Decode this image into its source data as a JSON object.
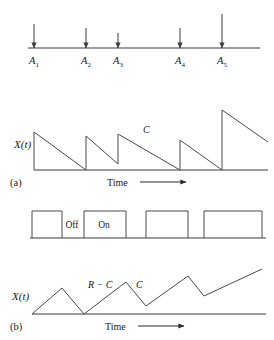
{
  "figure": {
    "caption_panels": [
      "(a)",
      "(b)"
    ],
    "axis_label": "X(t)",
    "time_label": "Time",
    "slope_label_c": "C",
    "slope_label_rc": "R − C",
    "state_off": "Off",
    "state_on": "On",
    "stroke_color": "#4a4a4a",
    "background": "#ffffff"
  },
  "arrivals": {
    "axis": {
      "x_start": 28,
      "x_end": 260,
      "y": 48
    },
    "markers": [
      {
        "label": "A",
        "subscript": "1",
        "x": 34,
        "arrow_top": 24,
        "height": 24
      },
      {
        "label": "A",
        "subscript": "2",
        "x": 86,
        "arrow_top": 28,
        "height": 20
      },
      {
        "label": "A",
        "subscript": "3",
        "x": 118,
        "arrow_top": 33,
        "height": 15
      },
      {
        "label": "A",
        "subscript": "4",
        "x": 180,
        "arrow_top": 28,
        "height": 20
      },
      {
        "label": "A",
        "subscript": "5",
        "x": 222,
        "arrow_top": 14,
        "height": 34
      }
    ],
    "label_y": 64
  },
  "chart_data": [
    {
      "type": "line",
      "name": "panel-a-sawtooth",
      "title": "(a)",
      "xlabel": "Time",
      "ylabel": "X(t)",
      "description": "Sawtooth: instantaneous upward jumps at arrival times A1..A5 followed by linear decay at rate C down to zero.",
      "baseline_y": 170,
      "x_axis": {
        "x_start": 34,
        "x_end": 268
      },
      "ylim": [
        0,
        60
      ],
      "points": [
        {
          "x": 34,
          "y": 0
        },
        {
          "x": 34,
          "y": 38
        },
        {
          "x": 86,
          "y": 0
        },
        {
          "x": 86,
          "y": 34
        },
        {
          "x": 118,
          "y": 6
        },
        {
          "x": 118,
          "y": 36
        },
        {
          "x": 180,
          "y": 0
        },
        {
          "x": 180,
          "y": 30
        },
        {
          "x": 222,
          "y": 0
        },
        {
          "x": 222,
          "y": 60
        },
        {
          "x": 268,
          "y": 28
        }
      ],
      "annotations": [
        {
          "text": "C",
          "x": 143,
          "y": 133
        }
      ]
    },
    {
      "type": "line",
      "name": "panel-middle-server-state",
      "title": "",
      "description": "Square wave showing server alternating between On (high) and Off (low) periods.",
      "baseline_y": 238,
      "high_y": 211,
      "x_axis": {
        "x_start": 30,
        "x_end": 266
      },
      "pulses": [
        {
          "start": 32,
          "end": 62
        },
        {
          "start": 84,
          "end": 126
        },
        {
          "start": 146,
          "end": 188
        },
        {
          "start": 204,
          "end": 262
        }
      ],
      "annotations": [
        {
          "text": "Off",
          "x": 72,
          "y": 228
        },
        {
          "text": "On",
          "x": 104,
          "y": 228
        }
      ]
    },
    {
      "type": "line",
      "name": "panel-b-triangular",
      "title": "(b)",
      "xlabel": "Time",
      "ylabel": "X(t)",
      "description": "Triangular workload: rises at rate R minus C while server is off/filling, falls at rate C, with upward drift.",
      "baseline_y": 314,
      "x_axis": {
        "x_start": 32,
        "x_end": 266
      },
      "ylim": [
        0,
        45
      ],
      "points": [
        {
          "x": 32,
          "y": 0
        },
        {
          "x": 62,
          "y": 26
        },
        {
          "x": 84,
          "y": 0
        },
        {
          "x": 126,
          "y": 32
        },
        {
          "x": 146,
          "y": 8
        },
        {
          "x": 188,
          "y": 38
        },
        {
          "x": 204,
          "y": 18
        },
        {
          "x": 262,
          "y": 45
        }
      ],
      "annotations": [
        {
          "text": "R − C",
          "x": 88,
          "y": 288
        },
        {
          "text": "C",
          "x": 136,
          "y": 288
        }
      ]
    }
  ],
  "panel_a": {
    "letter": "(a)",
    "letter_pos": {
      "x": 10,
      "y": 186
    },
    "ylabel_pos": {
      "x": 14,
      "y": 148
    },
    "time_arrow": {
      "text_x": 107,
      "text_y": 186,
      "line_x1": 140,
      "line_x2": 186,
      "y": 182
    }
  },
  "panel_b": {
    "letter": "(b)",
    "letter_pos": {
      "x": 10,
      "y": 330
    },
    "ylabel_pos": {
      "x": 12,
      "y": 300
    },
    "time_arrow": {
      "text_x": 105,
      "text_y": 330,
      "line_x1": 138,
      "line_x2": 184,
      "y": 326
    }
  }
}
